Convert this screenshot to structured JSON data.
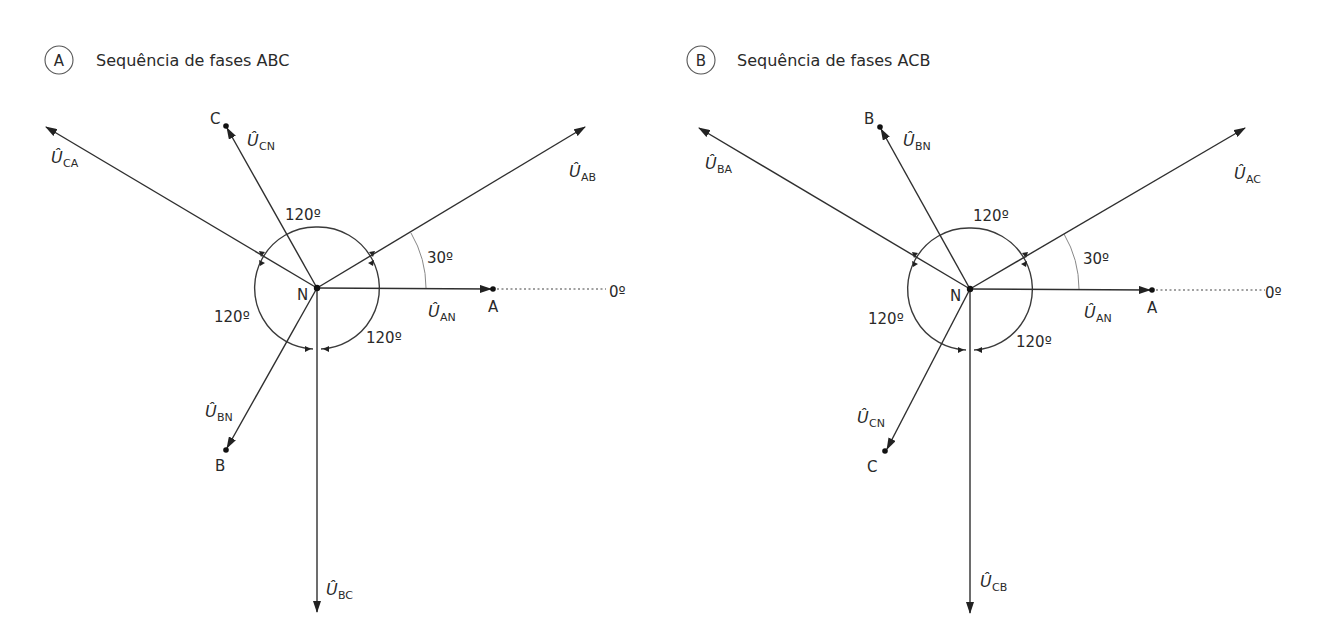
{
  "diagrams": [
    {
      "id": "A",
      "badge": "A",
      "title": "Sequência de fases ABC",
      "neutral_label": "N",
      "reference_label": "0º",
      "angle_30_label": "30º",
      "angle_labels": [
        "120º",
        "120º",
        "120º"
      ],
      "phase_points": [
        {
          "label": "A",
          "angle_deg": 0
        },
        {
          "label": "C",
          "angle_deg": 120
        },
        {
          "label": "B",
          "angle_deg": 240
        }
      ],
      "vectors": [
        {
          "name": "U_AN",
          "symbol": "Û",
          "subscript": "AN",
          "angle_deg": 0,
          "type": "phase"
        },
        {
          "name": "U_CN",
          "symbol": "Û",
          "subscript": "CN",
          "angle_deg": 120,
          "type": "phase"
        },
        {
          "name": "U_BN",
          "symbol": "Û",
          "subscript": "BN",
          "angle_deg": 240,
          "type": "phase"
        },
        {
          "name": "U_AB",
          "symbol": "Û",
          "subscript": "AB",
          "angle_deg": 30,
          "type": "line"
        },
        {
          "name": "U_CA",
          "symbol": "Û",
          "subscript": "CA",
          "angle_deg": 150,
          "type": "line"
        },
        {
          "name": "U_BC",
          "symbol": "Û",
          "subscript": "BC",
          "angle_deg": 270,
          "type": "line"
        }
      ]
    },
    {
      "id": "B",
      "badge": "B",
      "title": "Sequência de fases ACB",
      "neutral_label": "N",
      "reference_label": "0º",
      "angle_30_label": "30º",
      "angle_labels": [
        "120º",
        "120º",
        "120º"
      ],
      "phase_points": [
        {
          "label": "A",
          "angle_deg": 0
        },
        {
          "label": "B",
          "angle_deg": 120
        },
        {
          "label": "C",
          "angle_deg": 240
        }
      ],
      "vectors": [
        {
          "name": "U_AN",
          "symbol": "Û",
          "subscript": "AN",
          "angle_deg": 0,
          "type": "phase"
        },
        {
          "name": "U_BN",
          "symbol": "Û",
          "subscript": "BN",
          "angle_deg": 120,
          "type": "phase"
        },
        {
          "name": "U_CN",
          "symbol": "Û",
          "subscript": "CN",
          "angle_deg": 240,
          "type": "phase"
        },
        {
          "name": "U_AC",
          "symbol": "Û",
          "subscript": "AC",
          "angle_deg": 30,
          "type": "line"
        },
        {
          "name": "U_BA",
          "symbol": "Û",
          "subscript": "BA",
          "angle_deg": 150,
          "type": "line"
        },
        {
          "name": "U_CB",
          "symbol": "Û",
          "subscript": "CB",
          "angle_deg": 270,
          "type": "line"
        }
      ]
    }
  ]
}
